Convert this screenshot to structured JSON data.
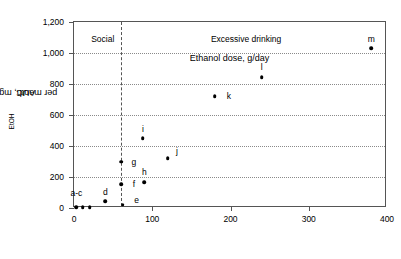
{
  "chart_data": {
    "type": "scatter",
    "title": "",
    "xlabel": "Ethanol dose, g/day",
    "ylabel_main": "AUC",
    "ylabel_sub": "EtOH",
    "ylabel_rest": " per month, mg/g/h",
    "xlim": [
      0,
      400
    ],
    "ylim": [
      0,
      1200
    ],
    "xticks": [
      0,
      100,
      200,
      300,
      400
    ],
    "xtick_labels": [
      "0",
      "100",
      "200",
      "300",
      "400"
    ],
    "yticks": [
      0,
      200,
      400,
      600,
      800,
      1000,
      1200
    ],
    "ytick_labels": [
      "0",
      "200",
      "400",
      "600",
      "800",
      "1,000",
      "1,200"
    ],
    "grid": "horizontal-dotted",
    "legend": "none",
    "annotations": [
      {
        "name": "social-region-label",
        "text": "Social",
        "x": 22,
        "y": 1120
      },
      {
        "name": "excessive-region-label",
        "text": "Excessive drinking",
        "x": 175,
        "y": 1120
      }
    ],
    "reference_lines": [
      {
        "name": "drinking-threshold",
        "orientation": "vertical",
        "x": 60,
        "style": "dashed"
      }
    ],
    "points": [
      {
        "label": "a-c",
        "x": 3,
        "y": 5,
        "label_dx": 0,
        "label_dy": 95
      },
      {
        "label": "",
        "x": 11,
        "y": 5,
        "label_dx": 0,
        "label_dy": 0
      },
      {
        "label": "",
        "x": 20,
        "y": 5,
        "label_dx": 0,
        "label_dy": 0
      },
      {
        "label": "d",
        "x": 40,
        "y": 42,
        "label_dx": 0,
        "label_dy": 62
      },
      {
        "label": "e",
        "x": 62,
        "y": 20,
        "label_dx": 14,
        "label_dy": 30
      },
      {
        "label": "f",
        "x": 60,
        "y": 155,
        "label_dx": 13,
        "label_dy": 0
      },
      {
        "label": "g",
        "x": 60,
        "y": 300,
        "label_dx": 13,
        "label_dy": 0
      },
      {
        "label": "h",
        "x": 90,
        "y": 168,
        "label_dx": 0,
        "label_dy": 62
      },
      {
        "label": "i",
        "x": 88,
        "y": 450,
        "label_dx": 0,
        "label_dy": 62
      },
      {
        "label": "j",
        "x": 120,
        "y": 320,
        "label_dx": 9,
        "label_dy": 50
      },
      {
        "label": "k",
        "x": 180,
        "y": 720,
        "label_dx": 14,
        "label_dy": 0
      },
      {
        "label": "l",
        "x": 240,
        "y": 845,
        "label_dx": 0,
        "label_dy": 62
      },
      {
        "label": "m",
        "x": 380,
        "y": 1030,
        "label_dx": 0,
        "label_dy": 62
      }
    ]
  }
}
